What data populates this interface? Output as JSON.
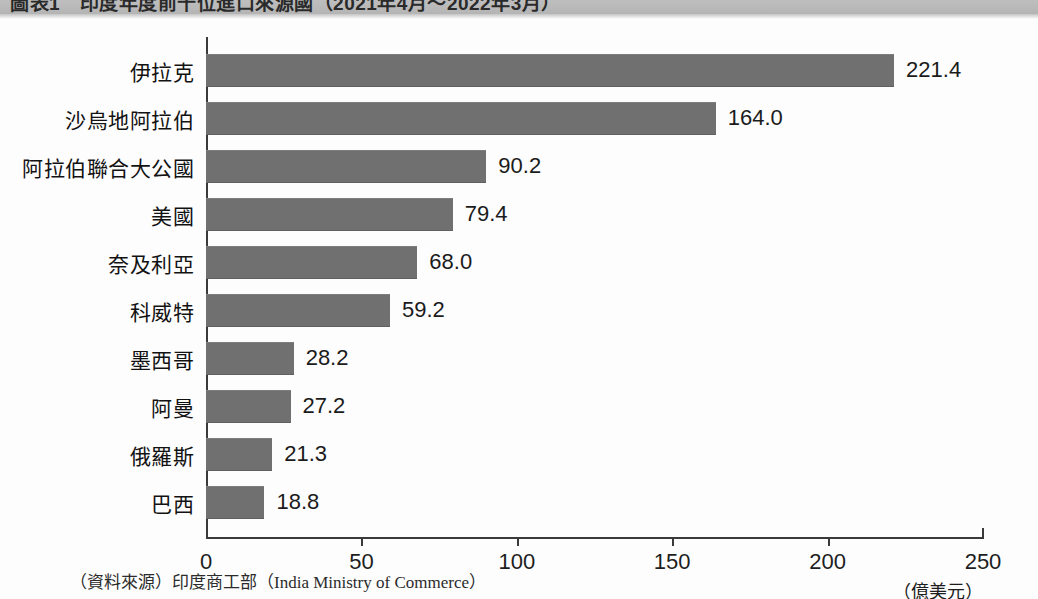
{
  "title": {
    "text": "圖表1　印度年度前十位進口來源國（2021年4月～2022年3月）",
    "clipped": true
  },
  "source": {
    "prefix": "（資料來源）",
    "agency_zh": "印度商工部",
    "agency_en": "（India Ministry of Commerce）"
  },
  "axis": {
    "ticks": [
      "0",
      "50",
      "100",
      "150",
      "200",
      "250"
    ],
    "unit": "（億美元）"
  },
  "colors": {
    "bar": "#707070",
    "axis": "#3a3a3a",
    "title_band": "#bdbdbd",
    "text": "#1a1a1a"
  },
  "chart_data": {
    "type": "bar",
    "orientation": "horizontal",
    "title": "圖表1　印度年度前十位進口來源國（2021年4月～2022年3月）",
    "xlabel": "（億美元）",
    "ylabel": "",
    "xlim": [
      0,
      250
    ],
    "xticks": [
      0,
      50,
      100,
      150,
      200,
      250
    ],
    "grid": false,
    "legend": false,
    "categories": [
      "伊拉克",
      "沙烏地阿拉伯",
      "阿拉伯聯合大公國",
      "美國",
      "奈及利亞",
      "科威特",
      "墨西哥",
      "阿曼",
      "俄羅斯",
      "巴西"
    ],
    "values": [
      221.4,
      164.0,
      90.2,
      79.4,
      68.0,
      59.2,
      28.2,
      27.2,
      21.3,
      18.8
    ],
    "value_labels": [
      "221.4",
      "164.0",
      "90.2",
      "79.4",
      "68.0",
      "59.2",
      "28.2",
      "27.2",
      "21.3",
      "18.8"
    ],
    "source": "（資料來源）印度商工部（India Ministry of Commerce）"
  }
}
